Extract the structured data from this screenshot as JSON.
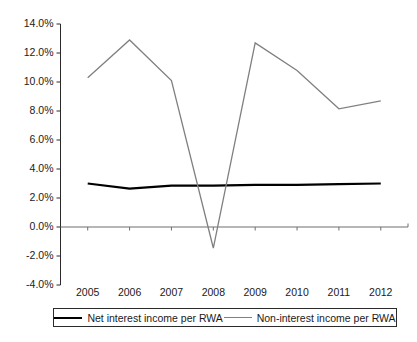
{
  "chart_data": {
    "type": "line",
    "title": "",
    "subtitle": "",
    "xlabel": "",
    "ylabel": "",
    "categories": [
      "2005",
      "2006",
      "2007",
      "2008",
      "2009",
      "2010",
      "2011",
      "2012"
    ],
    "series": [
      {
        "name": "Net interest income per RWA",
        "color": "#000000",
        "values": [
          3.0,
          2.65,
          2.85,
          2.85,
          2.9,
          2.9,
          2.95,
          3.0
        ]
      },
      {
        "name": "Non-interest income per RWA",
        "color": "#808080",
        "values": [
          10.3,
          12.9,
          10.1,
          -1.45,
          12.7,
          10.8,
          8.15,
          8.7
        ]
      }
    ],
    "ylim": [
      -4.0,
      14.0
    ],
    "ytick_values": [
      14.0,
      12.0,
      10.0,
      8.0,
      6.0,
      4.0,
      2.0,
      0.0,
      -2.0,
      -4.0
    ],
    "ytick_labels": [
      "14.0%",
      "12.0%",
      "10.0%",
      "8.0%",
      "6.0%",
      "4.0%",
      "2.0%",
      "0.0%",
      "-2.0%",
      "-4.0%"
    ],
    "grid": false,
    "zero_line": true,
    "legend_position": "bottom",
    "value_suffix": "%"
  },
  "legend": {
    "entries": [
      {
        "label": "Net interest income per RWA",
        "swatch": "series-a"
      },
      {
        "label": "Non-interest income per RWA",
        "swatch": "series-b"
      }
    ]
  }
}
